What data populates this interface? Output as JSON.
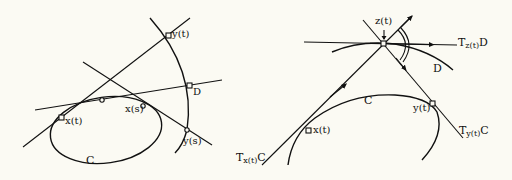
{
  "left_figure": {
    "labels": {
      "y_t": "y(t)",
      "D": "D",
      "x_s": "x(s)",
      "x_t": "x(t)",
      "y_s": "y(s)",
      "C": "C"
    }
  },
  "right_figure": {
    "labels": {
      "z_t": "z(t)",
      "T_zD_main": "T",
      "T_zD_sub": "z(t)",
      "T_zD_tail": "D",
      "D": "D",
      "C": "C",
      "x_t": "x(t)",
      "y_t": "y(t)",
      "T_yC_main": "T",
      "T_yC_sub": "y(t)",
      "T_yC_tail": "C",
      "T_xC_main": "T",
      "T_xC_sub": "x(t)",
      "T_xC_tail": "C"
    }
  },
  "colors": {
    "background": "#fbfaf3",
    "ink": "#111111"
  }
}
